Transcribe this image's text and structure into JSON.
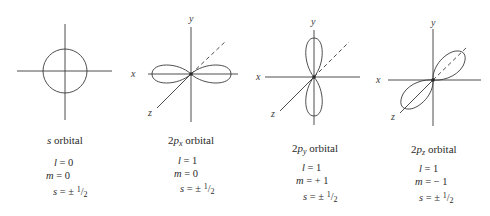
{
  "orbitals": [
    {
      "id": "s",
      "caption_prefix": "",
      "caption_main": "s",
      "caption_sub": "",
      "caption_suffix": " orbital",
      "axis_labels": {},
      "l_label": "l",
      "l_value": "= 0",
      "m_label": "m",
      "m_value": "= 0",
      "s_label": "s",
      "s_value": "= ± ",
      "s_num": "1",
      "s_den": "2"
    },
    {
      "id": "2px",
      "caption_prefix": "2",
      "caption_main": "p",
      "caption_sub": "x",
      "caption_suffix": " orbital",
      "axis_labels": {
        "x": "x",
        "y": "y",
        "z": "z"
      },
      "l_label": "l",
      "l_value": "= 1",
      "m_label": "m",
      "m_value": "= 0",
      "s_label": "s",
      "s_value": "= ± ",
      "s_num": "1",
      "s_den": "2"
    },
    {
      "id": "2py",
      "caption_prefix": "2",
      "caption_main": "p",
      "caption_sub": "y",
      "caption_suffix": " orbital",
      "axis_labels": {
        "x": "x",
        "y": "y",
        "z": "z"
      },
      "l_label": "l",
      "l_value": "= 1",
      "m_label": "m",
      "m_value": "= + 1",
      "s_label": "s",
      "s_value": "= ± ",
      "s_num": "1",
      "s_den": "2"
    },
    {
      "id": "2pz",
      "caption_prefix": "2",
      "caption_main": "p",
      "caption_sub": "z",
      "caption_suffix": " orbital",
      "axis_labels": {
        "x": "x",
        "y": "y",
        "z": "z"
      },
      "l_label": "l",
      "l_value": "= 1",
      "m_label": "m",
      "m_value": "= − 1",
      "s_label": "s",
      "s_value": "= ± ",
      "s_num": "1",
      "s_den": "2"
    }
  ]
}
